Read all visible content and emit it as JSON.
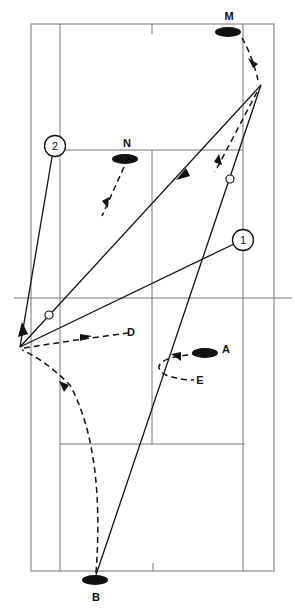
{
  "diagram": {
    "type": "badminton-court-tactic",
    "players": [
      {
        "id": "M",
        "label": "M",
        "x": 229,
        "y": 32
      },
      {
        "id": "N",
        "label": "N",
        "x": 125,
        "y": 159
      },
      {
        "id": "A",
        "label": "A",
        "x": 205,
        "y": 353
      },
      {
        "id": "B",
        "label": "B",
        "x": 95,
        "y": 580
      }
    ],
    "markers": [
      {
        "id": "1",
        "label": "1",
        "x": 243,
        "y": 240
      },
      {
        "id": "2",
        "label": "2",
        "x": 55,
        "y": 146
      }
    ],
    "points": [
      {
        "id": "D",
        "label": "D"
      },
      {
        "id": "E",
        "label": "E"
      }
    ],
    "colors": {
      "ink": "#111111",
      "court": "#777777",
      "background": "#ffffff"
    }
  }
}
